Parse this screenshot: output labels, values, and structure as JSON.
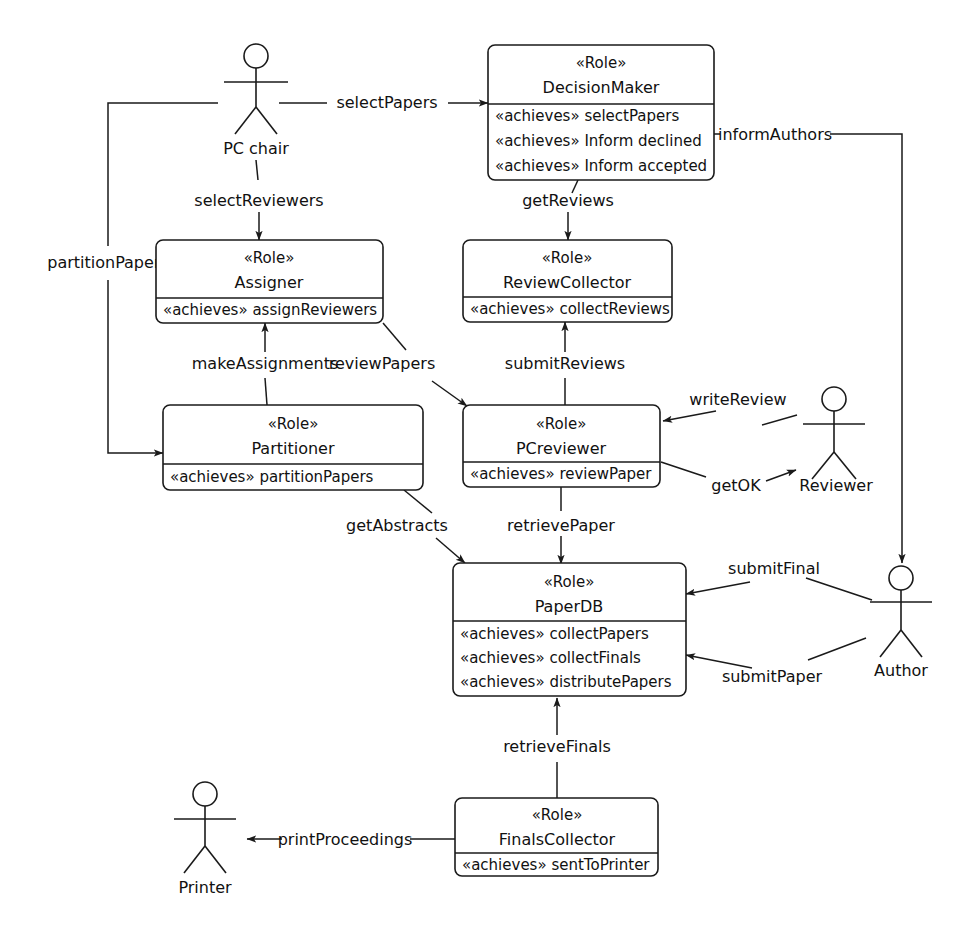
{
  "diagram": {
    "type": "uml-role-diagram",
    "stereotype_role": "«Role»",
    "stereotype_achieves": "«achieves»",
    "colors": {
      "background": "#ffffff",
      "stroke": "#1a1a1a",
      "text": "#111111"
    }
  },
  "roles": [
    {
      "id": "decision-maker",
      "stereotype": "«Role»",
      "name": "DecisionMaker",
      "achieves": [
        "selectPapers",
        "Inform declined",
        "Inform accepted"
      ]
    },
    {
      "id": "assigner",
      "stereotype": "«Role»",
      "name": "Assigner",
      "achieves": [
        "assignReviewers"
      ]
    },
    {
      "id": "review-collector",
      "stereotype": "«Role»",
      "name": "ReviewCollector",
      "achieves": [
        "collectReviews"
      ]
    },
    {
      "id": "partitioner",
      "stereotype": "«Role»",
      "name": "Partitioner",
      "achieves": [
        "partitionPapers"
      ]
    },
    {
      "id": "pc-reviewer",
      "stereotype": "«Role»",
      "name": "PCreviewer",
      "achieves": [
        "reviewPaper"
      ]
    },
    {
      "id": "paper-db",
      "stereotype": "«Role»",
      "name": "PaperDB",
      "achieves": [
        "collectPapers",
        "collectFinals",
        "distributePapers"
      ]
    },
    {
      "id": "finals-collector",
      "stereotype": "«Role»",
      "name": "FinalsCollector",
      "achieves": [
        "sentToPrinter"
      ]
    }
  ],
  "actors": [
    {
      "id": "pc-chair",
      "label": "PC chair"
    },
    {
      "id": "reviewer",
      "label": "Reviewer"
    },
    {
      "id": "author",
      "label": "Author"
    },
    {
      "id": "printer",
      "label": "Printer"
    }
  ],
  "protocols": [
    {
      "id": "select-papers",
      "label": "selectPapers",
      "from": "pc-chair",
      "to": "decision-maker"
    },
    {
      "id": "select-reviewers",
      "label": "selectReviewers",
      "from": "pc-chair",
      "to": "assigner"
    },
    {
      "id": "partition-papers",
      "label": "partitionPapers",
      "from": "pc-chair",
      "to": "partitioner"
    },
    {
      "id": "inform-authors",
      "label": "informAuthors",
      "from": "decision-maker",
      "to": "author"
    },
    {
      "id": "get-reviews",
      "label": "getReviews",
      "from": "decision-maker",
      "to": "review-collector"
    },
    {
      "id": "make-assignments",
      "label": "makeAssignments",
      "from": "partitioner",
      "to": "assigner"
    },
    {
      "id": "review-papers",
      "label": "reviewPapers",
      "from": "assigner",
      "to": "pc-reviewer"
    },
    {
      "id": "submit-reviews",
      "label": "submitReviews",
      "from": "pc-reviewer",
      "to": "review-collector"
    },
    {
      "id": "write-review",
      "label": "writeReview",
      "from": "reviewer",
      "to": "pc-reviewer"
    },
    {
      "id": "get-ok",
      "label": "getOK",
      "from": "pc-reviewer",
      "to": "reviewer"
    },
    {
      "id": "get-abstracts",
      "label": "getAbstracts",
      "from": "partitioner",
      "to": "paper-db"
    },
    {
      "id": "retrieve-paper",
      "label": "retrievePaper",
      "from": "pc-reviewer",
      "to": "paper-db"
    },
    {
      "id": "submit-final",
      "label": "submitFinal",
      "from": "author",
      "to": "paper-db"
    },
    {
      "id": "submit-paper",
      "label": "submitPaper",
      "from": "author",
      "to": "paper-db"
    },
    {
      "id": "retrieve-finals",
      "label": "retrieveFinals",
      "from": "finals-collector",
      "to": "paper-db"
    },
    {
      "id": "print-proceedings",
      "label": "printProceedings",
      "from": "finals-collector",
      "to": "printer"
    }
  ]
}
